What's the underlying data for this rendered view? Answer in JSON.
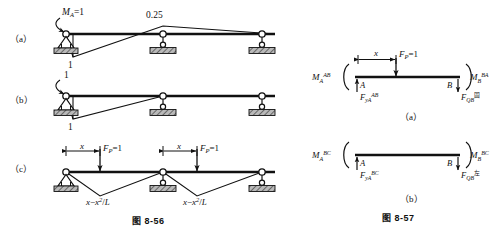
{
  "figure_left": {
    "caption": "图 8-56",
    "rows": [
      {
        "key": "a",
        "row_label": "（a）",
        "applied_label": "M_A=1",
        "peak_label": "0.25",
        "ordinate_label": "1"
      },
      {
        "key": "b",
        "row_label": "（b）",
        "top_label": "1",
        "bottom_label": "1"
      },
      {
        "key": "c",
        "row_label": "（c）",
        "dim_label_1": "x",
        "dim_label_2": "x",
        "load_label_1": "F_P=1",
        "load_label_2": "F_P=1",
        "ordinate_1": "x−x²/L",
        "ordinate_2": "x−x²/L"
      }
    ]
  },
  "figure_right": {
    "caption": "图 8-57",
    "panels": [
      {
        "key": "a",
        "panel_label": "（a）",
        "moment_left": "M_A^AB",
        "moment_right": "M_B^BA",
        "node_left": "A",
        "node_right": "B",
        "reaction_left": "F_yA^AB",
        "reaction_right": "F_QB^固",
        "dim_label": "x",
        "load_label": "F_P=1"
      },
      {
        "key": "b",
        "panel_label": "（b）",
        "moment_left": "M_A^BC",
        "moment_right": "M_B^BC",
        "node_left": "A",
        "node_right": "B",
        "reaction_left": "F_yA^BC",
        "reaction_right": "F_QB^左"
      }
    ]
  },
  "colors": {
    "ink": "#111111",
    "hatch": "#6e6e6e",
    "paper": "#ffffff"
  }
}
